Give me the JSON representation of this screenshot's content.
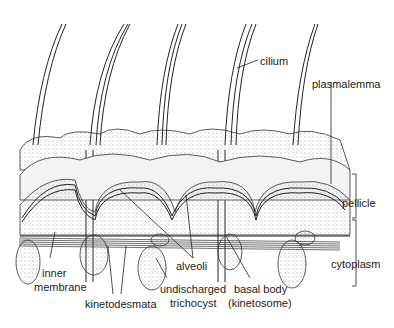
{
  "diagram": {
    "labels": {
      "cilium": "cilium",
      "plasmalemma": "plasmalemma",
      "pellicle": "pellicle",
      "cytoplasm": "cytoplasm",
      "inner_membrane_1": "inner",
      "inner_membrane_2": "membrane",
      "kinetodesmata": "kinetodesmata",
      "alveoli": "alveoli",
      "trichocyst_1": "undischarged",
      "trichocyst_2": "trichocyst",
      "basal_body_1": "basal body",
      "basal_body_2": "(kinetosome)"
    },
    "colors": {
      "ink": "#222222",
      "stipple": "#9a9a9a",
      "background": "#ffffff"
    }
  }
}
